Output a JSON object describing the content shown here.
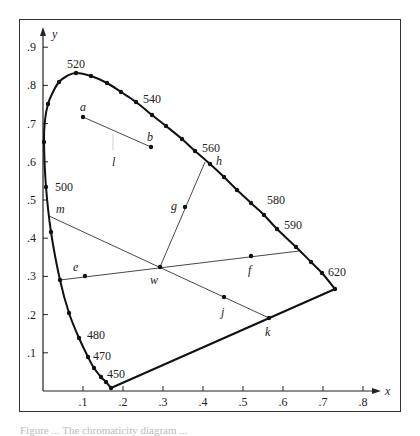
{
  "figure": {
    "axes": {
      "x_label": "x",
      "y_label": "y",
      "x_ticks": [
        ".1",
        ".2",
        ".3",
        ".4",
        ".5",
        ".6",
        ".7",
        ".8"
      ],
      "y_ticks": [
        ".1",
        ".2",
        ".3",
        ".4",
        ".5",
        ".6",
        ".7",
        ".8",
        ".9"
      ]
    },
    "wavelength_labels": [
      {
        "text": "520",
        "x": 67,
        "y": 68
      },
      {
        "text": "540",
        "x": 143,
        "y": 103
      },
      {
        "text": "560",
        "x": 202,
        "y": 152
      },
      {
        "text": "580",
        "x": 267,
        "y": 204
      },
      {
        "text": "590",
        "x": 284,
        "y": 229
      },
      {
        "text": "620",
        "x": 328,
        "y": 276
      },
      {
        "text": "500",
        "x": 55,
        "y": 191
      },
      {
        "text": "480",
        "x": 87,
        "y": 339
      },
      {
        "text": "470",
        "x": 93,
        "y": 360
      },
      {
        "text": "450",
        "x": 107,
        "y": 378
      }
    ],
    "point_labels": [
      {
        "text": "a",
        "x": 80,
        "y": 111
      },
      {
        "text": "b",
        "x": 147,
        "y": 141
      },
      {
        "text": "l",
        "x": 112,
        "y": 166
      },
      {
        "text": "h",
        "x": 216,
        "y": 165
      },
      {
        "text": "g",
        "x": 171,
        "y": 210
      },
      {
        "text": "m",
        "x": 56,
        "y": 213
      },
      {
        "text": "e",
        "x": 73,
        "y": 271
      },
      {
        "text": "f",
        "x": 248,
        "y": 274
      },
      {
        "text": "w",
        "x": 150,
        "y": 284
      },
      {
        "text": "j",
        "x": 221,
        "y": 316
      },
      {
        "text": "k",
        "x": 265,
        "y": 336
      }
    ],
    "caption": "Figure ... The chromaticity diagram ..."
  },
  "chart_data": {
    "type": "scatter",
    "title": "Chromaticity diagram",
    "xlabel": "x",
    "ylabel": "y",
    "xlim": [
      0,
      0.85
    ],
    "ylim": [
      0,
      0.95
    ],
    "grid": false,
    "spectral_locus_labels_nm": [
      450,
      470,
      480,
      500,
      520,
      540,
      560,
      580,
      590,
      620
    ],
    "named_points": {
      "a": [
        0.1,
        0.72
      ],
      "b": [
        0.27,
        0.64
      ],
      "e": [
        0.105,
        0.3
      ],
      "f": [
        0.52,
        0.35
      ],
      "g": [
        0.355,
        0.48
      ],
      "h": [
        0.4,
        0.595
      ],
      "j": [
        0.45,
        0.245
      ],
      "k": [
        0.565,
        0.19
      ],
      "w": [
        0.29,
        0.325
      ],
      "m": [
        0.015,
        0.46
      ]
    },
    "segments": [
      {
        "name": "ab",
        "from": "a",
        "to": "b"
      },
      {
        "name": "m-w-k",
        "from": [
          0.015,
          0.46
        ],
        "to": [
          0.565,
          0.19
        ]
      },
      {
        "name": "e-w-f",
        "from": [
          0.043,
          0.291
        ],
        "to": [
          0.64,
          0.366
        ]
      },
      {
        "name": "w-g-h",
        "from": [
          0.29,
          0.325
        ],
        "to": [
          0.405,
          0.599
        ]
      },
      {
        "name": "line-of-purples",
        "from": [
          0.17,
          0.007
        ],
        "to": [
          0.73,
          0.267
        ]
      }
    ]
  },
  "geometry": {
    "locus_path": [
      [
        111,
        388
      ],
      [
        106,
        382
      ],
      [
        101,
        377
      ],
      [
        94,
        368
      ],
      [
        88,
        357
      ],
      [
        79,
        338
      ],
      [
        69,
        313
      ],
      [
        60,
        280
      ],
      [
        51,
        232
      ],
      [
        46,
        187
      ],
      [
        44,
        142
      ],
      [
        45,
        120
      ],
      [
        48,
        104
      ],
      [
        53,
        92
      ],
      [
        59,
        82
      ],
      [
        67,
        76
      ],
      [
        76,
        73
      ],
      [
        91,
        76
      ],
      [
        107,
        83
      ],
      [
        121,
        92
      ],
      [
        136,
        102
      ],
      [
        152,
        115
      ],
      [
        166,
        126
      ],
      [
        182,
        139
      ],
      [
        195,
        151
      ],
      [
        210,
        164
      ],
      [
        224,
        177
      ],
      [
        237,
        190
      ],
      [
        251,
        203
      ],
      [
        264,
        215
      ],
      [
        277,
        229
      ],
      [
        296,
        247
      ],
      [
        311,
        262
      ],
      [
        322,
        273
      ],
      [
        335,
        289
      ]
    ],
    "locus_dots": [
      [
        106,
        382
      ],
      [
        101,
        377
      ],
      [
        94,
        368
      ],
      [
        88,
        357
      ],
      [
        79,
        338
      ],
      [
        69,
        313
      ],
      [
        60,
        280
      ],
      [
        51,
        232
      ],
      [
        46,
        187
      ],
      [
        44,
        142
      ],
      [
        48,
        104
      ],
      [
        59,
        82
      ],
      [
        76,
        73
      ],
      [
        91,
        76
      ],
      [
        107,
        83
      ],
      [
        121,
        92
      ],
      [
        136,
        102
      ],
      [
        152,
        115
      ],
      [
        166,
        126
      ],
      [
        182,
        139
      ],
      [
        195,
        151
      ],
      [
        210,
        164
      ],
      [
        224,
        177
      ],
      [
        237,
        190
      ],
      [
        251,
        203
      ],
      [
        264,
        215
      ],
      [
        277,
        229
      ],
      [
        296,
        247
      ],
      [
        311,
        262
      ],
      [
        322,
        273
      ],
      [
        335,
        289
      ],
      [
        111,
        388
      ]
    ],
    "purple_line": [
      [
        111,
        388
      ],
      [
        335,
        289
      ]
    ],
    "thin_lines": [
      [
        [
          83,
          117
        ],
        [
          151,
          147
        ]
      ],
      [
        [
          49,
          216
        ],
        [
          269,
          318
        ]
      ],
      [
        [
          60,
          280
        ],
        [
          299,
          251
        ]
      ],
      [
        [
          160,
          267
        ],
        [
          205,
          162
        ]
      ],
      [
        [
          113,
          134
        ],
        [
          113,
          150
        ]
      ]
    ],
    "point_dots": [
      [
        83,
        117
      ],
      [
        151,
        147
      ],
      [
        85,
        276
      ],
      [
        160,
        267
      ],
      [
        185,
        207
      ],
      [
        251,
        256
      ],
      [
        224,
        297
      ],
      [
        269,
        318
      ]
    ],
    "origin": [
      43,
      391
    ],
    "x_scale": 400,
    "y_scale": 382
  }
}
